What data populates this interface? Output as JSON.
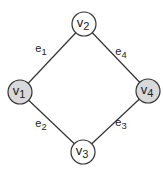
{
  "graph": {
    "nodes": [
      {
        "id": "v1",
        "base": "v",
        "sub": "1",
        "x": 20,
        "y": 92,
        "fill": "#d9d9d9"
      },
      {
        "id": "v2",
        "base": "v",
        "sub": "2",
        "x": 84,
        "y": 24,
        "fill": "#ffffff"
      },
      {
        "id": "v3",
        "base": "v",
        "sub": "3",
        "x": 83,
        "y": 152,
        "fill": "#ffffff"
      },
      {
        "id": "v4",
        "base": "v",
        "sub": "4",
        "x": 148,
        "y": 91,
        "fill": "#d9d9d9"
      }
    ],
    "edges": [
      {
        "id": "e1",
        "base": "e",
        "sub": "1",
        "from": "v1",
        "to": "v2",
        "lx": 41,
        "ly": 52
      },
      {
        "id": "e2",
        "base": "e",
        "sub": "2",
        "from": "v1",
        "to": "v3",
        "lx": 41,
        "ly": 127
      },
      {
        "id": "e3",
        "base": "e",
        "sub": "3",
        "from": "v4",
        "to": "v3",
        "lx": 121,
        "ly": 126
      },
      {
        "id": "e4",
        "base": "e",
        "sub": "4",
        "from": "v2",
        "to": "v4",
        "lx": 121,
        "ly": 55
      }
    ],
    "node_radius": 12,
    "stroke": "#333333"
  }
}
